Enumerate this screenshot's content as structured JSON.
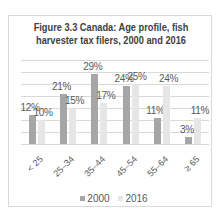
{
  "chart_data": {
    "type": "bar",
    "title": "Figure 3.3 Canada: Age profile, fish harvester tax filers, 2000 and 2016",
    "title_lines": [
      "Figure 3.3 Canada: Age profile, fish",
      "harvester tax filers, 2000 and 2016"
    ],
    "categories": [
      "< 25",
      "25–34",
      "35–44",
      "45–54",
      "55–64",
      "≥ 65"
    ],
    "series": [
      {
        "name": "2000",
        "values": [
          12,
          21,
          29,
          24,
          11,
          3
        ],
        "labels": [
          "12%",
          "21%",
          "29%",
          "24%",
          "11%",
          "3%"
        ],
        "color": "#a6a6a6"
      },
      {
        "name": "2016",
        "values": [
          10,
          15,
          17,
          25,
          24,
          11
        ],
        "labels": [
          "10%",
          "15%",
          "17%",
          "25%",
          "24%",
          "11%"
        ],
        "color": "#e6e6e6"
      }
    ],
    "xlabel": "",
    "ylabel": "",
    "ylim": [
      0,
      35
    ],
    "grid": true,
    "legend_position": "bottom"
  }
}
